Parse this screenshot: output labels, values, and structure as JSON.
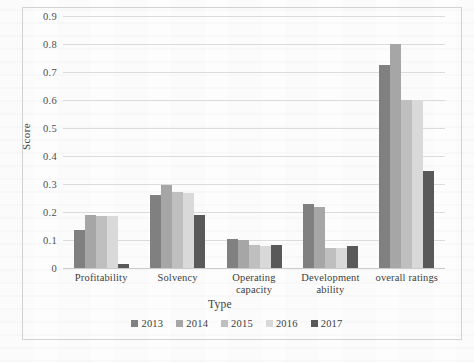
{
  "chart_data": {
    "type": "bar",
    "title": "",
    "xlabel": "Type",
    "ylabel": "Score",
    "ylim": [
      0,
      0.9
    ],
    "yticks": [
      "0",
      "0.1",
      "0.2",
      "0.3",
      "0.4",
      "0.5",
      "0.6",
      "0.7",
      "0.8",
      "0.9"
    ],
    "ytick_values": [
      0,
      0.1,
      0.2,
      0.3,
      0.4,
      0.5,
      0.6,
      0.7,
      0.8,
      0.9
    ],
    "grid": true,
    "legend_position": "bottom",
    "categories": [
      "Profitability",
      "Solvency",
      "Operating capacity",
      "Development ability",
      "overall ratings"
    ],
    "category_lines": [
      [
        "Profitability"
      ],
      [
        "Solvency"
      ],
      [
        "Operating capacity"
      ],
      [
        "Development",
        "ability"
      ],
      [
        "overall ratings"
      ]
    ],
    "series": [
      {
        "name": "2013",
        "color": "#808080",
        "values": [
          0.135,
          0.26,
          0.105,
          0.23,
          0.725
        ]
      },
      {
        "name": "2014",
        "color": "#a6a6a6",
        "values": [
          0.19,
          0.298,
          0.1,
          0.218,
          0.8
        ]
      },
      {
        "name": "2015",
        "color": "#bfbfbf",
        "values": [
          0.186,
          0.27,
          0.082,
          0.073,
          0.6
        ]
      },
      {
        "name": "2016",
        "color": "#d9d9d9",
        "values": [
          0.186,
          0.268,
          0.078,
          0.073,
          0.6
        ]
      },
      {
        "name": "2017",
        "color": "#595959",
        "values": [
          0.015,
          0.19,
          0.082,
          0.078,
          0.345
        ]
      }
    ]
  }
}
